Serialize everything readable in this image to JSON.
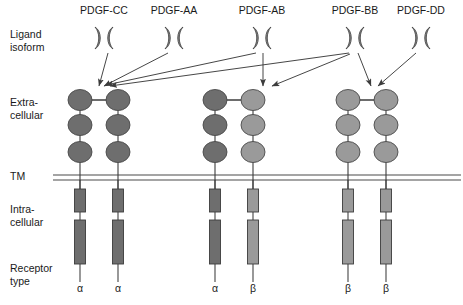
{
  "figure": {
    "row_labels": {
      "ligand": "Ligand\nisoform",
      "extracellular": "Extra-\ncellular",
      "tm": "TM",
      "intracellular": "Intra-\ncellular",
      "receptor_type": "Receptor\ntype"
    },
    "ligands": [
      {
        "id": "pdgf-cc",
        "label": "PDGF-CC",
        "x": 104,
        "label_x": 104,
        "label_y": 4
      },
      {
        "id": "pdgf-aa",
        "label": "PDGF-AA",
        "x": 174,
        "label_x": 174,
        "label_y": 4
      },
      {
        "id": "pdgf-ab",
        "label": "PDGF-AB",
        "x": 262,
        "label_x": 262,
        "label_y": 4
      },
      {
        "id": "pdgf-bb",
        "label": "PDGF-BB",
        "x": 355,
        "label_x": 355,
        "label_y": 4
      },
      {
        "id": "pdgf-dd",
        "label": "PDGF-DD",
        "x": 421,
        "label_x": 421,
        "label_y": 4
      }
    ],
    "receptor_columns": [
      {
        "id": "alpha-alpha",
        "chains": [
          "alpha",
          "alpha"
        ],
        "type_labels": [
          "α",
          "α"
        ],
        "x_left": 80,
        "x_right": 118
      },
      {
        "id": "alpha-beta",
        "chains": [
          "alpha",
          "beta"
        ],
        "type_labels": [
          "α",
          "β"
        ],
        "x_left": 215,
        "x_right": 253
      },
      {
        "id": "beta-beta",
        "chains": [
          "beta",
          "beta"
        ],
        "type_labels": [
          "β",
          "β"
        ],
        "x_left": 348,
        "x_right": 386
      }
    ],
    "bindings": [
      {
        "from": "pdgf-cc",
        "to": "alpha-alpha"
      },
      {
        "from": "pdgf-aa",
        "to": "alpha-alpha"
      },
      {
        "from": "pdgf-ab",
        "to": "alpha-alpha"
      },
      {
        "from": "pdgf-ab",
        "to": "alpha-beta"
      },
      {
        "from": "pdgf-bb",
        "to": "alpha-alpha"
      },
      {
        "from": "pdgf-bb",
        "to": "alpha-beta"
      },
      {
        "from": "pdgf-bb",
        "to": "beta-beta"
      },
      {
        "from": "pdgf-dd",
        "to": "beta-beta"
      }
    ],
    "colors": {
      "alpha_domain": "#6e6e6e",
      "beta_domain": "#9a9a9a",
      "alpha_box": "#6e6e6e",
      "beta_box": "#9a9a9a",
      "ligand": "#8a8a8a",
      "stroke": "#3c3c3c",
      "membrane": "#4a4a4a",
      "background": "#ffffff"
    },
    "geometry": {
      "ligand_y": 38,
      "ectodomain_top_y": 96,
      "membrane_y": 177,
      "receptor_type_y": 288
    }
  }
}
